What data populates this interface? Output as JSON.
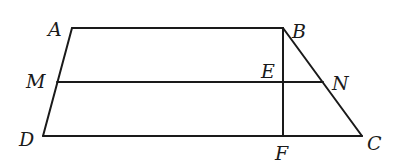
{
  "diagram": {
    "type": "geometry",
    "points": {
      "A": {
        "x": 72,
        "y": 28,
        "label": "A"
      },
      "B": {
        "x": 283,
        "y": 28,
        "label": "B"
      },
      "M": {
        "x": 57,
        "y": 82,
        "label": "M"
      },
      "E": {
        "x": 283,
        "y": 82,
        "label": "E"
      },
      "N": {
        "x": 323,
        "y": 82,
        "label": "N"
      },
      "D": {
        "x": 43,
        "y": 136,
        "label": "D"
      },
      "F": {
        "x": 283,
        "y": 136,
        "label": "F"
      },
      "C": {
        "x": 362,
        "y": 136,
        "label": "C"
      }
    },
    "segments": [
      {
        "from": "A",
        "to": "B"
      },
      {
        "from": "A",
        "to": "D"
      },
      {
        "from": "D",
        "to": "C"
      },
      {
        "from": "B",
        "to": "C"
      },
      {
        "from": "M",
        "to": "N"
      },
      {
        "from": "B",
        "to": "F"
      }
    ],
    "labels": [
      {
        "text": "A",
        "x": 48,
        "y": 36
      },
      {
        "text": "B",
        "x": 292,
        "y": 38
      },
      {
        "text": "M",
        "x": 26,
        "y": 88
      },
      {
        "text": "E",
        "x": 261,
        "y": 78
      },
      {
        "text": "N",
        "x": 332,
        "y": 90
      },
      {
        "text": "D",
        "x": 19,
        "y": 146
      },
      {
        "text": "F",
        "x": 275,
        "y": 160
      },
      {
        "text": "C",
        "x": 367,
        "y": 150
      }
    ],
    "stroke_color": "#1a1a1a",
    "background": "#ffffff"
  }
}
